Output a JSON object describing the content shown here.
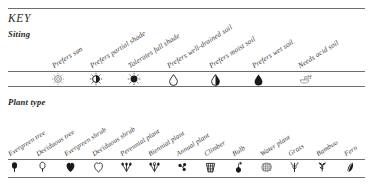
{
  "document": {
    "title": "KEY"
  },
  "siting": {
    "section_title": "Siting",
    "columns": [
      {
        "label": "Prefers sun",
        "icon": "sun-open-icon",
        "x": 58
      },
      {
        "label": "Prefers partial shade",
        "icon": "sun-half-icon",
        "x": 96
      },
      {
        "label": "Tolerates full shade",
        "icon": "sun-filled-icon",
        "x": 134
      },
      {
        "label": "Prefers well-drained soil",
        "icon": "droplet-open-icon",
        "x": 173
      },
      {
        "label": "Prefers moist soil",
        "icon": "droplet-half-icon",
        "x": 215
      },
      {
        "label": "Prefers wet soil",
        "icon": "droplet-filled-icon",
        "x": 258
      },
      {
        "label": "Needs acid soil",
        "icon": "ph-acid-icon",
        "x": 304
      }
    ]
  },
  "plant_type": {
    "section_title": "Plant type",
    "columns": [
      {
        "label": "Evergreen tree",
        "icon": "tree-filled-icon",
        "x": 14
      },
      {
        "label": "Deciduous tree",
        "icon": "tree-open-icon",
        "x": 42
      },
      {
        "label": "Evergreen shrub",
        "icon": "shrub-filled-icon",
        "x": 70
      },
      {
        "label": "Deciduous shrub",
        "icon": "shrub-open-icon",
        "x": 98
      },
      {
        "label": "Perennial plant",
        "icon": "perennial-icon",
        "x": 126
      },
      {
        "label": "Biennial plant",
        "icon": "biennial-icon",
        "x": 154
      },
      {
        "label": "Annual plant",
        "icon": "annual-icon",
        "x": 182
      },
      {
        "label": "Climber",
        "icon": "climber-trellis-icon",
        "x": 210
      },
      {
        "label": "Bulb",
        "icon": "bulb-icon",
        "x": 238
      },
      {
        "label": "Water plant",
        "icon": "water-plant-icon",
        "x": 266
      },
      {
        "label": "Grass",
        "icon": "grass-icon",
        "x": 294
      },
      {
        "label": "Bamboo",
        "icon": "bamboo-icon",
        "x": 322
      },
      {
        "label": "Fern",
        "icon": "fern-icon",
        "x": 350
      }
    ]
  },
  "rules": [
    {
      "name": "top-rule",
      "y": 8,
      "weight": "thick"
    },
    {
      "name": "siting-header-rule",
      "y": 71,
      "weight": "thick"
    },
    {
      "name": "siting-footer-rule",
      "y": 86,
      "weight": "thick"
    },
    {
      "name": "planttype-header-rule",
      "y": 159,
      "weight": "thick"
    },
    {
      "name": "planttype-footer-rule",
      "y": 177,
      "weight": "thick"
    }
  ],
  "colors": {
    "ink": "#1a1a1a",
    "rule": "#6e6e6a",
    "paper": "#ffffff"
  }
}
